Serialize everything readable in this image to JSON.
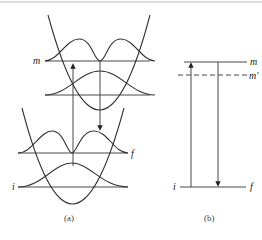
{
  "figure": {
    "panel_a": {
      "caption": "(a)",
      "labels": {
        "m": "m",
        "f": "f",
        "i": "i"
      },
      "description": "Two displaced harmonic potential wells with vibrational wavefunctions; upward arrow (absorption i→m) and downward arrow (emission m→f)"
    },
    "panel_b": {
      "caption": "(b)",
      "labels": {
        "m": "m",
        "m_prime": "m'",
        "i": "i",
        "f": "f"
      },
      "description": "Energy level diagram: levels m, m' (dashed), and i/f; upward arrow from i to m, downward arrow from m to f"
    }
  }
}
